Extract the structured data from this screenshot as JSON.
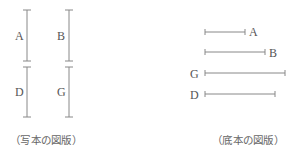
{
  "figures": [
    {
      "caption": "（写本の図版）",
      "orientation": "vertical",
      "segments": [
        {
          "label": "A",
          "x": 27,
          "y1": 10,
          "y2": 61,
          "label_x": 15,
          "label_y": 40
        },
        {
          "label": "B",
          "x": 69,
          "y1": 10,
          "y2": 61,
          "label_x": 57,
          "label_y": 40
        },
        {
          "label": "D",
          "x": 27,
          "y1": 67,
          "y2": 117,
          "label_x": 15,
          "label_y": 96
        },
        {
          "label": "G",
          "x": 69,
          "y1": 67,
          "y2": 117,
          "label_x": 57,
          "label_y": 96
        }
      ]
    },
    {
      "caption": "（底本の図版）",
      "orientation": "horizontal",
      "segments": [
        {
          "label": "A",
          "y": 32,
          "x1": 205,
          "x2": 245,
          "label_x": 249,
          "label_y": 36
        },
        {
          "label": "B",
          "y": 52,
          "x1": 205,
          "x2": 265,
          "label_x": 269,
          "label_y": 57
        },
        {
          "label": "G",
          "y": 73,
          "x1": 205,
          "x2": 285,
          "label_x": 190,
          "label_y": 78
        },
        {
          "label": "D",
          "y": 94,
          "x1": 205,
          "x2": 275,
          "label_x": 190,
          "label_y": 99
        }
      ]
    }
  ],
  "colors": {
    "line": "#888888",
    "text": "#555555"
  }
}
